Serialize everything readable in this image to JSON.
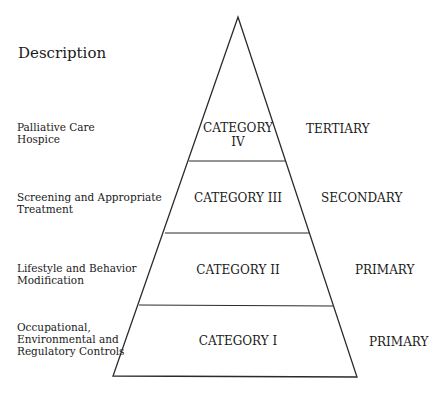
{
  "diagram": {
    "type": "pyramid",
    "column_heading": "Description",
    "tiers": [
      {
        "category": "CATEGORY IV",
        "category_lines": [
          "CATEGORY",
          "IV"
        ],
        "description_lines": [
          "Palliative Care",
          "Hospice"
        ],
        "level": "TERTIARY"
      },
      {
        "category": "CATEGORY III",
        "category_lines": [
          "CATEGORY III"
        ],
        "description_lines": [
          "Screening and Appropriate",
          "Treatment"
        ],
        "level": "SECONDARY"
      },
      {
        "category": "CATEGORY II",
        "category_lines": [
          "CATEGORY II"
        ],
        "description_lines": [
          "Lifestyle and Behavior",
          "Modification"
        ],
        "level": "PRIMARY"
      },
      {
        "category": "CATEGORY I",
        "category_lines": [
          "CATEGORY I"
        ],
        "description_lines": [
          "Occupational,",
          "Environmental and",
          "Regulatory Controls"
        ],
        "level": "PRIMARY"
      }
    ],
    "caption_note": "",
    "colors": {
      "line": "#2a2a2a",
      "background": "#ffffff",
      "text": "#1a1a1a"
    }
  }
}
